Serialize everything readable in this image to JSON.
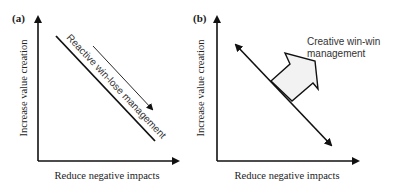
{
  "panels": [
    {
      "id": "a",
      "label": "(a)",
      "y_axis_label": "Increase value creation",
      "x_axis_label": "Reduce negative impacts",
      "diagonal_label": "Reactive win-lose management",
      "arrow_direction": "down-right along trade-off line"
    },
    {
      "id": "b",
      "label": "(b)",
      "y_axis_label": "Increase value creation",
      "x_axis_label": "Reduce negative impacts",
      "annotation": {
        "line1": "Creative win-win",
        "line2": "management"
      },
      "arrow_direction": "double-headed trade-off line with block arrow pushing outward"
    }
  ],
  "colors": {
    "stroke": "#111111",
    "block_arrow_fill": "#f2f2f2",
    "text": "#222222"
  }
}
